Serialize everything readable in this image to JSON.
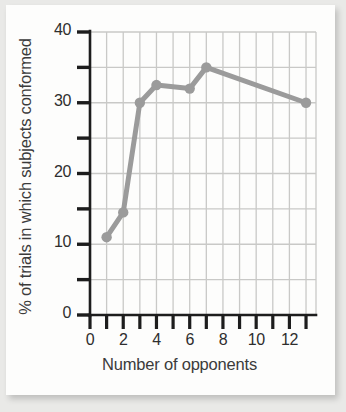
{
  "figure": {
    "background_color": "#fdfdfc",
    "page_background_color": "#e9e9e7"
  },
  "chart_data": {
    "type": "line",
    "title": "",
    "xlabel": "Number of opponents",
    "ylabel": "% of trials in which subjects conformed",
    "x": [
      1,
      2,
      3,
      4,
      6,
      7,
      13
    ],
    "values": [
      11,
      14.5,
      30,
      32.5,
      32,
      35,
      30
    ],
    "series": [
      {
        "name": "% of trials in which subjects conformed",
        "x": [
          1,
          2,
          3,
          4,
          6,
          7,
          13
        ],
        "values": [
          11,
          14.5,
          30,
          32.5,
          32,
          35,
          30
        ]
      }
    ],
    "xlim": [
      0,
      13.6
    ],
    "ylim": [
      0,
      40
    ],
    "x_major_ticks": [
      0,
      2,
      4,
      6,
      8,
      10,
      12
    ],
    "x_all_ticks": [
      0,
      1,
      2,
      3,
      4,
      5,
      6,
      7,
      8,
      9,
      10,
      11,
      12,
      13
    ],
    "x_tick_labels": [
      "0",
      "2",
      "4",
      "6",
      "8",
      "10",
      "12"
    ],
    "y_major_ticks": [
      0,
      10,
      20,
      30,
      40
    ],
    "y_minor_ticks": [
      5,
      15,
      25,
      35
    ],
    "y_tick_labels": [
      "0",
      "10",
      "20",
      "30",
      "40"
    ],
    "grid": true,
    "grid_color": "#c9c9c7",
    "legend": false,
    "legend_position": "none",
    "line_color": "#9b9b9b",
    "marker": "circle",
    "marker_color": "#9b9b9b",
    "axis_color": "#1d1d1d"
  },
  "axis": {
    "y_title": "% of trials in which subjects conformed",
    "x_title": "Number of opponents"
  }
}
